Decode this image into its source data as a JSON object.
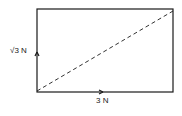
{
  "diagram": {
    "type": "vector-parallelogram",
    "vectors": [
      {
        "name": "vertical",
        "label": "√3 N",
        "direction": "up"
      },
      {
        "name": "horizontal",
        "label": "3 N",
        "direction": "right"
      }
    ],
    "resultant": {
      "style": "dashed",
      "direction": "diagonal"
    },
    "colors": {
      "line": "#1a1a1a",
      "background": "#ffffff"
    }
  }
}
